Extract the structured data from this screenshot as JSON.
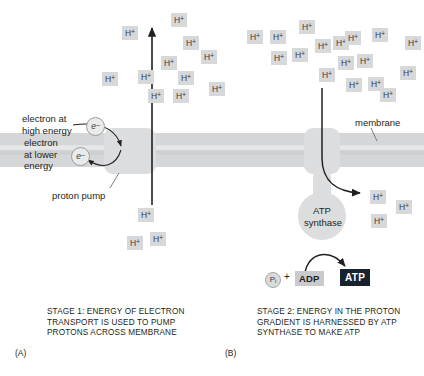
{
  "figure": {
    "proton_label": "H",
    "proton_charge": "+"
  },
  "labels": {
    "electron_high": "electron at\nhigh energy",
    "electron_low": "electron\nat lower\nenergy",
    "electron_high_symbol": "e",
    "electron_low_symbol": "e",
    "electron_charge": "–",
    "proton_pump": "proton pump",
    "membrane": "membrane",
    "atp_synthase": "ATP\nsynthase"
  },
  "reaction": {
    "pi": "P",
    "pi_sub": "i",
    "plus": "+",
    "adp": "ADP",
    "atp": "ATP"
  },
  "panels": [
    {
      "letter": "(A)",
      "caption": "STAGE 1: ENERGY OF ELECTRON\nTRANSPORT IS USED TO PUMP\nPROTONS ACROSS MEMBRANE"
    },
    {
      "letter": "(B)",
      "caption": "STAGE 2: ENERGY IN THE PROTON\nGRADIENT IS HARNESSED BY ATP\nSYNTHASE TO MAKE ATP"
    }
  ],
  "colors": {
    "membrane": "#d5d6d7",
    "protein": "#dcdddf",
    "proton_chip": "#d7d8da",
    "atp_box": "#16222e",
    "adp_box": "#c9cacc",
    "text": "#231f20",
    "arrow": "#231f20"
  },
  "protons_above": [
    {
      "x": 171,
      "y": 13
    },
    {
      "x": 122,
      "y": 26
    },
    {
      "x": 183,
      "y": 36
    },
    {
      "x": 201,
      "y": 50
    },
    {
      "x": 161,
      "y": 56
    },
    {
      "x": 209,
      "y": 82
    },
    {
      "x": 178,
      "y": 71
    },
    {
      "x": 138,
      "y": 70
    },
    {
      "x": 102,
      "y": 72
    },
    {
      "x": 148,
      "y": 89
    },
    {
      "x": 173,
      "y": 89
    },
    {
      "x": 247,
      "y": 30
    },
    {
      "x": 270,
      "y": 30
    },
    {
      "x": 299,
      "y": 20
    },
    {
      "x": 271,
      "y": 51
    },
    {
      "x": 292,
      "y": 48
    },
    {
      "x": 315,
      "y": 39
    },
    {
      "x": 333,
      "y": 36
    },
    {
      "x": 345,
      "y": 31
    },
    {
      "x": 338,
      "y": 56
    },
    {
      "x": 357,
      "y": 54
    },
    {
      "x": 319,
      "y": 68
    },
    {
      "x": 346,
      "y": 78
    },
    {
      "x": 368,
      "y": 77
    },
    {
      "x": 380,
      "y": 88
    },
    {
      "x": 400,
      "y": 66
    },
    {
      "x": 405,
      "y": 36
    },
    {
      "x": 372,
      "y": 28
    }
  ],
  "protons_below_left": [
    {
      "x": 138,
      "y": 208
    },
    {
      "x": 127,
      "y": 236
    },
    {
      "x": 150,
      "y": 232
    }
  ],
  "protons_below_right": [
    {
      "x": 370,
      "y": 190
    },
    {
      "x": 396,
      "y": 200
    },
    {
      "x": 371,
      "y": 214
    }
  ]
}
